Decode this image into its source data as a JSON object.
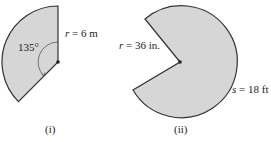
{
  "figure_i": {
    "radius_var": "r",
    "radius_value": " = 6 m",
    "angle_label": "135°",
    "caption": "(i)"
  },
  "figure_ii": {
    "radius_var": "r",
    "radius_value": " = 36 in.",
    "arc_var": "s",
    "arc_value": " = 18 ft",
    "caption": "(ii)"
  },
  "colors": {
    "fill": "#d6d6d6",
    "stroke": "#333333"
  }
}
